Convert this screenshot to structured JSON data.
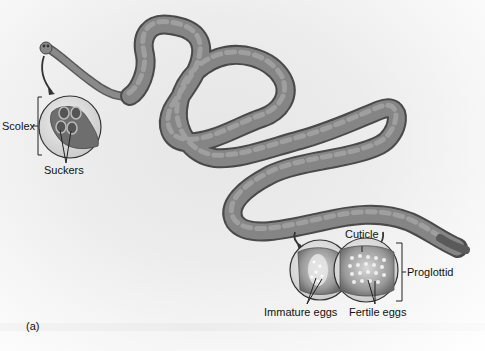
{
  "figure": {
    "panel_label": "(a)",
    "style": "grayscale illustration",
    "labels": {
      "scolex": "Scolex",
      "suckers": "Suckers",
      "cuticle": "Cuticle",
      "proglottid": "Proglottid",
      "immature_eggs": "Immature eggs",
      "fertile_eggs": "Fertile eggs"
    },
    "colors": {
      "worm_body": "#7a7a7a",
      "worm_highlight": "#a8a8a8",
      "worm_outline": "#4a4a4a",
      "background": "#ececec",
      "text": "#111111"
    }
  }
}
